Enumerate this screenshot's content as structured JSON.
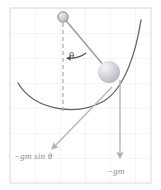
{
  "figure": {
    "type": "physics-diagram",
    "background_color": "#ffffff",
    "grid": {
      "visible": true,
      "line_color": "#e9e9ef",
      "border_color": "#dcdce4",
      "spacing_px": 25,
      "origin_x": 10,
      "origin_y": 8,
      "frame": {
        "x": 10,
        "y": 8,
        "width": 141,
        "height": 175
      }
    },
    "elements": {
      "pivot": {
        "name": "pivot-circle",
        "cx": 63,
        "cy": 17,
        "r": 5,
        "fill": "#c9c9d1",
        "stroke": "#8a8a94"
      },
      "bob": {
        "name": "pendulum-bob",
        "cx": 109,
        "cy": 72,
        "r": 11,
        "fill": "#c8c8d0",
        "highlight": "#f0f0f4"
      },
      "rod": {
        "name": "pendulum-rod",
        "x1": 63,
        "y1": 17,
        "x2": 109,
        "y2": 72,
        "stroke": "#9a9aa4"
      },
      "vertical_dashed": {
        "name": "vertical-reference-line",
        "x1": 63,
        "y1": 22,
        "x2": 63,
        "y2": 110,
        "stroke": "#b8a8b8",
        "dash": "4,3"
      },
      "arc_track": {
        "name": "pendulum-arc-track",
        "stroke": "#5a5a5a",
        "d": "M 18,83 C 36,112 78,116 105,100 C 126,86 137,50 141,20"
      },
      "angle_arc": {
        "name": "angle-arc",
        "stroke": "#4a4a4a",
        "label": "θ"
      },
      "force_tangential": {
        "name": "tangential-force-arrow",
        "x1": 110,
        "y1": 86,
        "x2": 52,
        "y2": 150,
        "stroke": "#b4b4be",
        "label": "−gm sin θ"
      },
      "force_gravity": {
        "name": "gravity-force-arrow",
        "x1": 120,
        "y1": 82,
        "x2": 120,
        "y2": 158,
        "stroke": "#b4b4be",
        "label": "−gm"
      }
    },
    "labels": {
      "theta": "θ",
      "tangential_force": "−gm sin θ",
      "gravity_force": "−gm"
    },
    "colors": {
      "arrow": "#b4b4be",
      "label_text": "#8c8c96",
      "curve": "#5a5a5a",
      "dashed_line": "#b8a8b8",
      "grid": "#e9e9ef"
    }
  }
}
